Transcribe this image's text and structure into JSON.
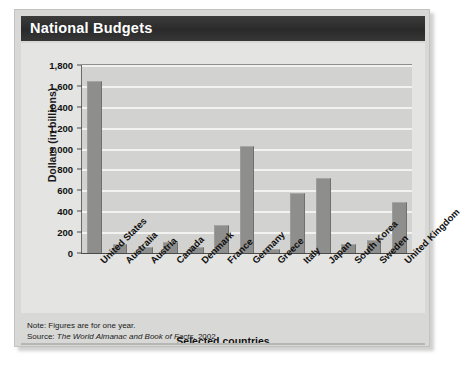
{
  "figure": {
    "title": "National Budgets",
    "x_axis_title": "Selected countries",
    "y_axis_title": "Dollars (in billions)",
    "note": "Note: Figures are for one year.",
    "source_prefix": "Source:",
    "source_text": "The World Almanac and Book of Facts,",
    "source_year": "2002"
  },
  "colors": {
    "header_bar": "#2a2a2a",
    "panel_background": "#d8d8d6",
    "chart_background": "#e4e4e2",
    "plot_background": "#d2d2d0",
    "bar_fill": "#8e8e8c",
    "gridline": "#f2f2f0",
    "text": "#111111"
  },
  "chart_data": {
    "type": "bar",
    "title": "National Budgets",
    "xlabel": "Selected countries",
    "ylabel": "Dollars (in billions)",
    "ylim": [
      0,
      1800
    ],
    "ytick_labels": [
      "1,800",
      "1,600",
      "1,400",
      "1,200",
      "1,000",
      "800",
      "600",
      "400",
      "200",
      "0"
    ],
    "ytick_values": [
      1800,
      1600,
      1400,
      1200,
      1000,
      800,
      600,
      400,
      200,
      0
    ],
    "grid": true,
    "legend": "none",
    "categories": [
      "United States",
      "Australia",
      "Austria",
      "Canada",
      "Denmark",
      "France",
      "Germany",
      "Greece",
      "Italy",
      "Japan",
      "South Korea",
      "Sweden",
      "United Kingdom"
    ],
    "values": [
      1650,
      90,
      60,
      110,
      60,
      265,
      1025,
      35,
      570,
      720,
      90,
      120,
      490
    ],
    "units": "billions of dollars"
  }
}
